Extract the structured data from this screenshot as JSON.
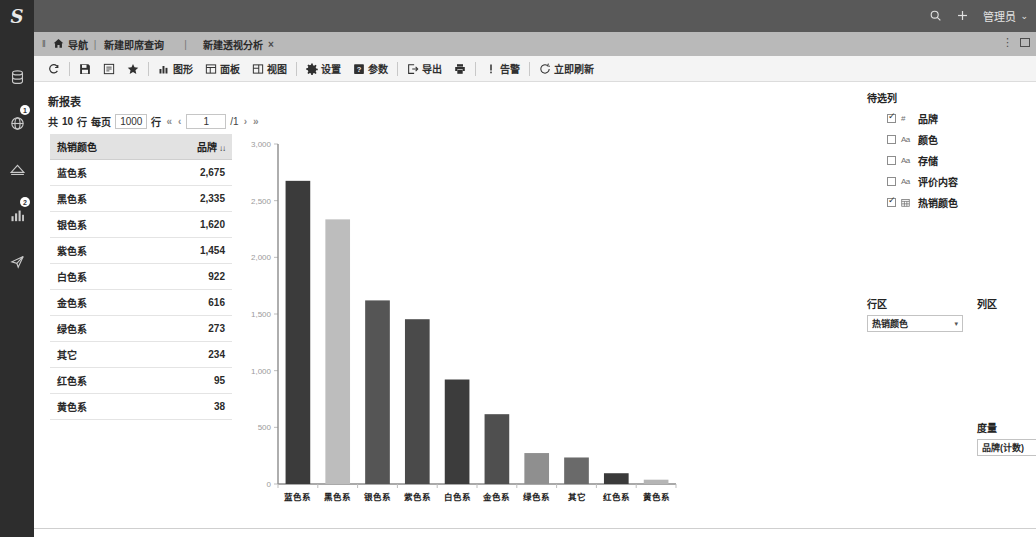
{
  "topbar": {
    "logo": "S",
    "search_icon": "search-icon",
    "add_icon": "plus-icon",
    "user_label": "管理员",
    "user_caret": "⌄"
  },
  "rail": {
    "items": [
      {
        "name": "database-icon",
        "badge": ""
      },
      {
        "name": "globe-icon",
        "badge": "1"
      },
      {
        "name": "analysis-icon",
        "badge": ""
      },
      {
        "name": "bar-chart-icon",
        "badge": "2"
      },
      {
        "name": "send-icon",
        "badge": ""
      }
    ]
  },
  "tabs": {
    "grip": "‖",
    "home_label": "导航",
    "separator": "|",
    "items": [
      {
        "label": "新建即席查询",
        "active": false,
        "closable": false
      },
      {
        "label": "新建透视分析",
        "active": true,
        "closable": true
      }
    ],
    "close_glyph": "×"
  },
  "toolbar": {
    "buttons": [
      {
        "icon": "refresh-icon",
        "label": ""
      },
      {
        "icon": "save-icon",
        "label": ""
      },
      {
        "icon": "save-as-icon",
        "label": ""
      },
      {
        "icon": "favorite-icon",
        "label": ""
      },
      {
        "icon": "chart-icon",
        "label": "图形"
      },
      {
        "icon": "panel-icon",
        "label": "面板"
      },
      {
        "icon": "view-icon",
        "label": "视图"
      },
      {
        "icon": "settings-icon",
        "label": "设置"
      },
      {
        "icon": "param-icon",
        "label": "参数"
      },
      {
        "icon": "export-icon",
        "label": "导出"
      },
      {
        "icon": "print-icon",
        "label": ""
      },
      {
        "icon": "alert-icon",
        "label": "告警"
      },
      {
        "icon": "refresh-now-icon",
        "label": "立即刷新"
      }
    ]
  },
  "report": {
    "title": "新报表",
    "pager": {
      "total_prefix": "共",
      "total_rows": "10",
      "row_unit": "行",
      "per_page_label": "每页",
      "per_page_value": "1000",
      "per_page_unit": "行",
      "first": "«",
      "prev": "‹",
      "page": "1",
      "of": "/1",
      "next": "›",
      "last": "»"
    }
  },
  "table": {
    "columns": [
      {
        "label": "热销颜色",
        "align": "left"
      },
      {
        "label": "品牌",
        "align": "right",
        "sort": "↓↓"
      }
    ],
    "rows": [
      {
        "color": "蓝色系",
        "value": "2,675"
      },
      {
        "color": "黑色系",
        "value": "2,335"
      },
      {
        "color": "银色系",
        "value": "1,620"
      },
      {
        "color": "紫色系",
        "value": "1,454"
      },
      {
        "color": "白色系",
        "value": "922"
      },
      {
        "color": "金色系",
        "value": "616"
      },
      {
        "color": "绿色系",
        "value": "273"
      },
      {
        "color": "其它",
        "value": "234"
      },
      {
        "color": "红色系",
        "value": "95"
      },
      {
        "color": "黄色系",
        "value": "38"
      }
    ]
  },
  "chart_data": {
    "type": "bar",
    "title": "",
    "xlabel": "",
    "ylabel": "",
    "categories": [
      "蓝色系",
      "黑色系",
      "银色系",
      "紫色系",
      "白色系",
      "金色系",
      "绿色系",
      "其它",
      "红色系",
      "黄色系"
    ],
    "values": [
      2675,
      2335,
      1620,
      1454,
      922,
      616,
      273,
      234,
      95,
      38
    ],
    "series": [
      {
        "name": "品牌(计数)",
        "values": [
          2675,
          2335,
          1620,
          1454,
          922,
          616,
          273,
          234,
          95,
          38
        ]
      }
    ],
    "ylim": [
      0,
      3000
    ],
    "yticks": [
      0,
      500,
      1000,
      1500,
      2000,
      2500,
      3000
    ],
    "ytick_labels": [
      "0",
      "500",
      "1,000",
      "1,500",
      "2,000",
      "2,500",
      "3,000"
    ],
    "grid": false,
    "legend": "none",
    "bar_colors": [
      "#3b3b3b",
      "#bdbdbd",
      "#555555",
      "#4a4a4a",
      "#3c3c3c",
      "#4f4f4f",
      "#8f8f8f",
      "#6a6a6a",
      "#3a3a3a",
      "#b5b5b5"
    ]
  },
  "right_panel": {
    "available_title": "待选列",
    "fields": [
      {
        "label": "品牌",
        "type": "#",
        "type_icon": "number-icon",
        "checked": true
      },
      {
        "label": "颜色",
        "type": "Aa",
        "type_icon": "text-icon",
        "checked": false
      },
      {
        "label": "存储",
        "type": "Aa",
        "type_icon": "text-icon",
        "checked": false
      },
      {
        "label": "评价内容",
        "type": "Aa",
        "type_icon": "text-icon",
        "checked": false
      },
      {
        "label": "热销颜色",
        "type": "",
        "type_icon": "calendar-icon",
        "checked": true
      }
    ],
    "row_zone": {
      "label": "行区",
      "value": "热销颜色",
      "caret": "▾"
    },
    "col_zone": {
      "label": "列区",
      "value": "",
      "caret": ""
    },
    "measure_zone": {
      "label": "度量",
      "value": "品牌(计数)",
      "caret": "▾"
    }
  },
  "window_controls": {
    "menu": "⋮",
    "maximize": "maximize-icon"
  },
  "colors": {
    "topbar_bg": "#595959",
    "rail_bg": "#2d2d2d",
    "tabstrip_bg": "#b9b9b9",
    "toolbar_bg": "#f4f4f4",
    "header_bg": "#e2e2e2"
  }
}
